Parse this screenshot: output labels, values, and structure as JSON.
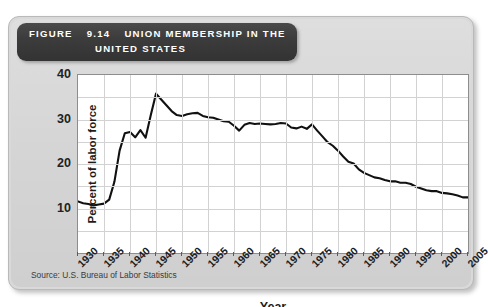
{
  "figure": {
    "number_label": "FIGURE",
    "number": "9.14",
    "title_line1": "UNION MEMBERSHIP IN THE",
    "title_line2": "UNITED STATES",
    "source": "Source: U.S. Bureau of Labor Statistics",
    "header_bg": "#383838",
    "card_bg": "#d6d6d6",
    "line_color": "#111111",
    "grid_color": "#d2d2d2"
  },
  "chart_data": {
    "type": "line",
    "title": "Union Membership in the United States",
    "xlabel": "Year",
    "ylabel": "Percent of labor force",
    "xlim": [
      1930,
      2005
    ],
    "ylim": [
      0,
      40
    ],
    "grid": true,
    "legend": "none",
    "x_tick_labels": [
      "1930",
      "1935",
      "1940",
      "1945",
      "1950",
      "1955",
      "1960",
      "1965",
      "1970",
      "1975",
      "1980",
      "1985",
      "1990",
      "1995",
      "2000",
      "2005"
    ],
    "y_tick_labels": [
      "10",
      "20",
      "30",
      "40"
    ],
    "y_tick_values": [
      10,
      20,
      30,
      40
    ],
    "y_gridline_values": [
      0,
      5,
      10,
      15,
      20,
      25,
      30,
      35,
      40
    ],
    "series": [
      {
        "name": "Union membership",
        "units": "percent of labor force",
        "x": [
          1930,
          1931,
          1932,
          1933,
          1934,
          1935,
          1936,
          1937,
          1938,
          1939,
          1940,
          1941,
          1942,
          1943,
          1944,
          1945,
          1946,
          1947,
          1948,
          1949,
          1950,
          1951,
          1952,
          1953,
          1954,
          1955,
          1956,
          1957,
          1958,
          1959,
          1960,
          1961,
          1962,
          1963,
          1964,
          1965,
          1966,
          1967,
          1968,
          1969,
          1970,
          1971,
          1972,
          1973,
          1974,
          1975,
          1976,
          1977,
          1978,
          1979,
          1980,
          1981,
          1982,
          1983,
          1984,
          1985,
          1986,
          1987,
          1988,
          1989,
          1990,
          1991,
          1992,
          1993,
          1994,
          1995,
          1996,
          1997,
          1998,
          1999,
          2000,
          2001,
          2002,
          2003,
          2004,
          2005
        ],
        "y": [
          11.6,
          11.2,
          11.0,
          10.7,
          10.9,
          11.1,
          12.0,
          16.0,
          23.0,
          26.9,
          27.2,
          26.0,
          27.6,
          25.9,
          31.0,
          35.8,
          34.5,
          33.2,
          31.9,
          31.0,
          30.8,
          31.2,
          31.4,
          31.5,
          30.8,
          30.5,
          30.4,
          30.0,
          29.6,
          29.5,
          28.6,
          27.5,
          28.8,
          29.2,
          29.0,
          29.1,
          29.0,
          28.9,
          29.0,
          29.2,
          29.1,
          28.2,
          28.0,
          28.4,
          27.9,
          28.9,
          27.5,
          26.2,
          24.9,
          24.1,
          23.0,
          21.7,
          20.5,
          20.1,
          18.8,
          18.0,
          17.5,
          17.0,
          16.8,
          16.4,
          16.1,
          16.1,
          15.8,
          15.8,
          15.5,
          14.9,
          14.5,
          14.1,
          13.9,
          13.9,
          13.5,
          13.4,
          13.2,
          12.9,
          12.5,
          12.5
        ]
      }
    ]
  }
}
